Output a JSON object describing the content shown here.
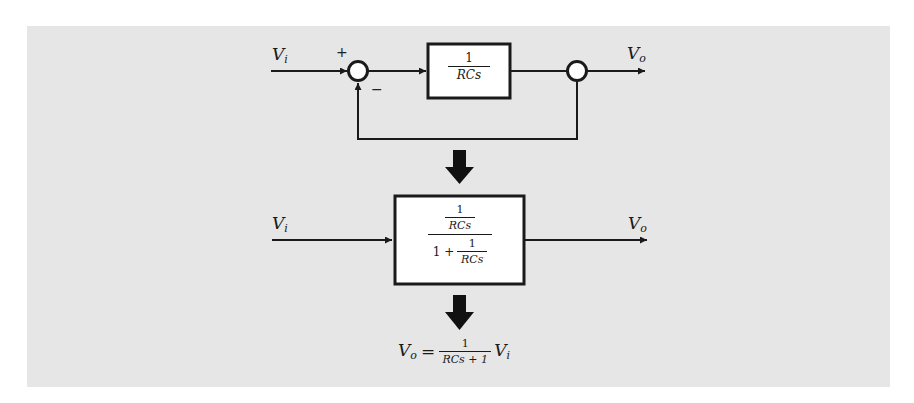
{
  "diagram": {
    "title": "",
    "background_color": "#e6e6e6",
    "line_color": "#1a1a1a",
    "top_loop": {
      "input_label": "V",
      "input_sub": "i",
      "plus_sign": "+",
      "minus_sign": "−",
      "block": {
        "numerator": "1",
        "denominator": "RCs"
      },
      "output_label": "V",
      "output_sub": "o"
    },
    "reduced": {
      "input_label": "V",
      "input_sub": "i",
      "block": {
        "outer_numerator": {
          "numerator": "1",
          "denominator": "RCs"
        },
        "outer_denominator_prefix": "1 +",
        "outer_denominator_frac": {
          "numerator": "1",
          "denominator": "RCs"
        }
      },
      "output_label": "V",
      "output_sub": "o"
    },
    "result": {
      "lhs": "V",
      "lhs_sub": "o",
      "equals": "=",
      "numerator": "1",
      "denominator": "RCs + 1",
      "rhs": "V",
      "rhs_sub": "i"
    },
    "nodes": [
      {
        "id": "Vi",
        "type": "input"
      },
      {
        "id": "sum",
        "type": "summing-junction",
        "signs": [
          "+",
          "−"
        ]
      },
      {
        "id": "G",
        "type": "block",
        "transfer": "1/(RCs)"
      },
      {
        "id": "takeoff",
        "type": "takeoff-point"
      },
      {
        "id": "Vo",
        "type": "output"
      }
    ],
    "edges": [
      {
        "from": "Vi",
        "to": "sum",
        "sign": "+"
      },
      {
        "from": "sum",
        "to": "G"
      },
      {
        "from": "G",
        "to": "takeoff"
      },
      {
        "from": "takeoff",
        "to": "Vo"
      },
      {
        "from": "takeoff",
        "to": "sum",
        "sign": "−",
        "label": "unity feedback"
      }
    ],
    "steps": [
      "Unity negative-feedback loop with forward block 1/(RCs)",
      "Reduced to single block (1/RCs)/(1 + 1/RCs)",
      "Vo = 1/(RCs+1) Vi"
    ]
  }
}
